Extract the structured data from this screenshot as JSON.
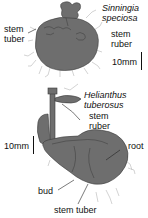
{
  "figure": {
    "colors": {
      "tuber_fill": "#6e6e6e",
      "tuber_stroke": "#3a3a3a",
      "root_hair": "#b5b5b5",
      "text": "#111111",
      "background": "#ffffff"
    },
    "top_panel": {
      "species_line1": "Sinningia",
      "species_line2": "speciosa",
      "label_left_1": "stem",
      "label_left_2": "tuber",
      "label_right_1": "stem",
      "label_right_2": "ruber",
      "scale_label": "10mm"
    },
    "bottom_panel": {
      "species_line1": "Helianthus",
      "species_line2": "tuberosus",
      "label_ruber_1": "stem",
      "label_ruber_2": "ruber",
      "label_root": "root",
      "label_bud": "bud",
      "label_stem_tuber": "stem tuber",
      "scale_label": "10mm"
    }
  }
}
